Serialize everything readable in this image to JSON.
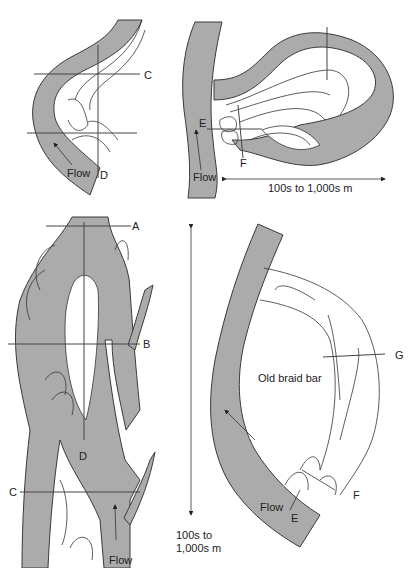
{
  "colors": {
    "channel_fill": "#ababab",
    "outline": "#333333",
    "background": "#ffffff"
  },
  "panels": {
    "top_left": {
      "labels": {
        "c": "C",
        "d": "D",
        "flow": "Flow"
      }
    },
    "top_right": {
      "labels": {
        "e": "E",
        "f": "F",
        "flow": "Flow",
        "scale": "100s to 1,000s m"
      }
    },
    "bottom_left": {
      "labels": {
        "a": "A",
        "b": "B",
        "c": "C",
        "d": "D",
        "flow": "Flow"
      }
    },
    "bottom_middle": {
      "scale_line1": "100s to",
      "scale_line2": "1,000s m"
    },
    "bottom_right": {
      "labels": {
        "g": "G",
        "old_braid_bar": "Old braid bar",
        "flow": "Flow",
        "e": "E",
        "f": "F"
      }
    }
  }
}
